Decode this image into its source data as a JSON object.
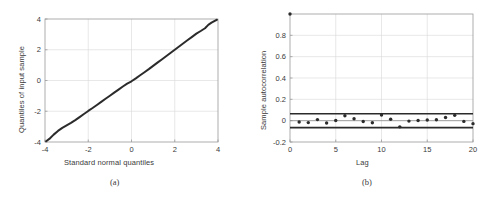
{
  "figure": {
    "background": "#ffffff",
    "ink": "#3a3a3a",
    "grid_color": "#d8d8d8",
    "axis_color": "#9a9a9a"
  },
  "panels": [
    {
      "id": "a",
      "caption": "(a)",
      "xlabel": "Standard normal quantiles",
      "ylabel": "Quantiles of input sample"
    },
    {
      "id": "b",
      "caption": "(b)",
      "xlabel": "Lag",
      "ylabel": "Sample autocorrelation"
    }
  ],
  "chart_data": [
    {
      "type": "scatter",
      "panel": "a",
      "title": "",
      "xlabel": "Standard normal quantiles",
      "ylabel": "Quantiles of input sample",
      "xlim": [
        -4,
        4
      ],
      "ylim": [
        -4,
        4
      ],
      "xticks": [
        -4,
        -2,
        0,
        2,
        4
      ],
      "yticks": [
        -4,
        -2,
        0,
        2,
        4
      ],
      "xticklabels": [
        "-4",
        "-2",
        "0",
        "2",
        "4"
      ],
      "yticklabels": [
        "-4",
        "-2",
        "0",
        "2",
        "4"
      ],
      "grid": true,
      "legend": "none",
      "series": [
        {
          "name": "qq-points",
          "marker": "dot",
          "color": "#2b2b2b",
          "x": [
            -3.95,
            -3.8,
            -3.6,
            -3.4,
            -3.2,
            -3.0,
            -2.8,
            -2.6,
            -2.4,
            -2.2,
            -2.0,
            -1.8,
            -1.6,
            -1.4,
            -1.2,
            -1.0,
            -0.8,
            -0.6,
            -0.4,
            -0.2,
            0.0,
            0.2,
            0.4,
            0.6,
            0.8,
            1.0,
            1.2,
            1.4,
            1.6,
            1.8,
            2.0,
            2.2,
            2.4,
            2.6,
            2.8,
            3.0,
            3.2,
            3.4,
            3.55,
            3.7,
            3.85,
            3.95
          ],
          "y": [
            -3.95,
            -3.8,
            -3.52,
            -3.28,
            -3.08,
            -2.92,
            -2.76,
            -2.58,
            -2.38,
            -2.18,
            -1.98,
            -1.79,
            -1.59,
            -1.39,
            -1.19,
            -0.99,
            -0.79,
            -0.59,
            -0.39,
            -0.2,
            -0.05,
            0.14,
            0.34,
            0.54,
            0.74,
            0.95,
            1.16,
            1.37,
            1.58,
            1.79,
            2.0,
            2.21,
            2.42,
            2.63,
            2.84,
            3.05,
            3.22,
            3.4,
            3.62,
            3.76,
            3.88,
            3.95
          ]
        }
      ],
      "reference_line": {
        "slope": 1.0,
        "intercept": 0.0
      }
    },
    {
      "type": "scatter",
      "panel": "b",
      "title": "",
      "xlabel": "Lag",
      "ylabel": "Sample autocorrelation",
      "xlim": [
        0,
        20
      ],
      "ylim": [
        -0.2,
        1.0
      ],
      "xticks": [
        0,
        5,
        10,
        15,
        20
      ],
      "yticks": [
        -0.2,
        0,
        0.2,
        0.4,
        0.6,
        0.8
      ],
      "xticklabels": [
        "0",
        "5",
        "10",
        "15",
        "20"
      ],
      "yticklabels": [
        "-0.2",
        "0",
        "0.2",
        "0.4",
        "0.6",
        "0.8"
      ],
      "grid": true,
      "legend": "none",
      "categories": [
        0,
        1,
        2,
        3,
        4,
        5,
        6,
        7,
        8,
        9,
        10,
        11,
        12,
        13,
        14,
        15,
        16,
        17,
        18,
        19,
        20
      ],
      "values": [
        1.0,
        -0.012,
        -0.018,
        0.01,
        -0.022,
        0.002,
        0.046,
        0.018,
        -0.008,
        -0.02,
        0.053,
        0.013,
        -0.058,
        -0.004,
        0.001,
        0.006,
        0.009,
        0.03,
        0.05,
        -0.007,
        -0.028
      ],
      "marker": "dot",
      "marker_color": "#2b2b2b",
      "confidence_bounds": {
        "upper": 0.065,
        "lower": -0.065,
        "color": "#2b2b2b"
      },
      "zero_line": 0
    }
  ]
}
